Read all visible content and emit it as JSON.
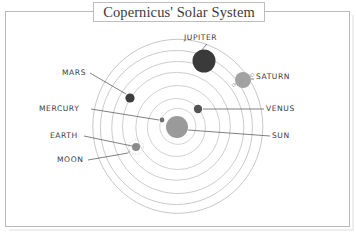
{
  "figure": {
    "title": "Copernicus' Solar System",
    "frame_color": "#b9b9b9",
    "background": "#ffffff"
  },
  "chart_data": {
    "type": "diagram",
    "title": "Copernicus' Solar System",
    "subtitle": "",
    "xlabel": "",
    "ylabel": "",
    "grid": false,
    "legend": "none",
    "center": {
      "label": "SUN",
      "x": 177,
      "y": 127,
      "radius": 11,
      "color": "#9a9a9a"
    },
    "orbit_rings": [
      {
        "index": 1,
        "rx": 18,
        "ry": 18,
        "color": "#cfcfcf"
      },
      {
        "index": 2,
        "rx": 29,
        "ry": 29,
        "color": "#cbcbcb"
      },
      {
        "index": 3,
        "rx": 42,
        "ry": 42,
        "color": "#c9c9c9"
      },
      {
        "index": 4,
        "rx": 54,
        "ry": 54,
        "color": "#c7c7c7"
      },
      {
        "index": 5,
        "rx": 66,
        "ry": 66,
        "color": "#c5c5c5"
      },
      {
        "index": 6,
        "rx": 76,
        "ry": 77,
        "color": "#c3c3c3"
      },
      {
        "index": 7,
        "rx": 85,
        "ry": 87,
        "color": "#c1c1c1"
      }
    ],
    "bodies": [
      {
        "name": "SUN",
        "x": 177,
        "y": 127,
        "radius": 11,
        "color": "#9a9a9a",
        "orbit": 0,
        "rings": false,
        "moon_orbit": false
      },
      {
        "name": "MERCURY",
        "x": 162,
        "y": 120,
        "radius": 2.4,
        "color": "#6f6f6f",
        "orbit": 1,
        "rings": false,
        "moon_orbit": false
      },
      {
        "name": "VENUS",
        "x": 198,
        "y": 109,
        "radius": 4.2,
        "color": "#545454",
        "orbit": 2,
        "rings": false,
        "moon_orbit": false
      },
      {
        "name": "EARTH",
        "x": 136,
        "y": 147,
        "radius": 4.0,
        "color": "#8a8a8a",
        "orbit": 3,
        "rings": false,
        "moon_orbit": true
      },
      {
        "name": "MARS",
        "x": 130,
        "y": 98,
        "radius": 4.6,
        "color": "#3d3d3d",
        "orbit": 4,
        "rings": false,
        "moon_orbit": false
      },
      {
        "name": "JUPITER",
        "x": 204,
        "y": 61,
        "radius": 11.5,
        "color": "#3a3a3a",
        "orbit": 6,
        "rings": false,
        "moon_orbit": false
      },
      {
        "name": "SATURN",
        "x": 243,
        "y": 80,
        "radius": 8.0,
        "color": "#a2a2a2",
        "orbit": 7,
        "rings": true,
        "moon_orbit": false
      },
      {
        "name": "MOON",
        "x": 129,
        "y": 152,
        "radius": 1.2,
        "color": "#bdbdbd",
        "orbit": 0,
        "rings": false,
        "moon_orbit": false
      }
    ],
    "labels": [
      {
        "name": "JUPITER",
        "text": "JUPITER",
        "x": 184,
        "y": 33,
        "leader_from": [
          207,
          44
        ],
        "leader_to": [
          200,
          52
        ]
      },
      {
        "name": "SATURN",
        "text": "SATURN",
        "x": 256,
        "y": 72,
        "leader_from": [
          254,
          79
        ],
        "leader_to": [
          251,
          79
        ]
      },
      {
        "name": "MARS",
        "text": "MARS",
        "x": 62,
        "y": 68,
        "leader_from": [
          90,
          73
        ],
        "leader_to": [
          126,
          94
        ]
      },
      {
        "name": "VENUS",
        "text": "VENUS",
        "x": 266,
        "y": 104,
        "leader_from": [
          264,
          109
        ],
        "leader_to": [
          203,
          109
        ]
      },
      {
        "name": "MERCURY",
        "text": "MERCURY",
        "x": 39,
        "y": 104,
        "leader_from": [
          91,
          109
        ],
        "leader_to": [
          159,
          120
        ]
      },
      {
        "name": "SUN",
        "text": "SUN",
        "x": 272,
        "y": 131,
        "leader_from": [
          270,
          136
        ],
        "leader_to": [
          188,
          130
        ]
      },
      {
        "name": "EARTH",
        "text": "EARTH",
        "x": 50,
        "y": 131,
        "leader_from": [
          84,
          136
        ],
        "leader_to": [
          132,
          146
        ]
      },
      {
        "name": "MOON",
        "text": "MOON",
        "x": 57,
        "y": 155,
        "leader_from": [
          88,
          160
        ],
        "leader_to": [
          128,
          153
        ]
      }
    ]
  }
}
